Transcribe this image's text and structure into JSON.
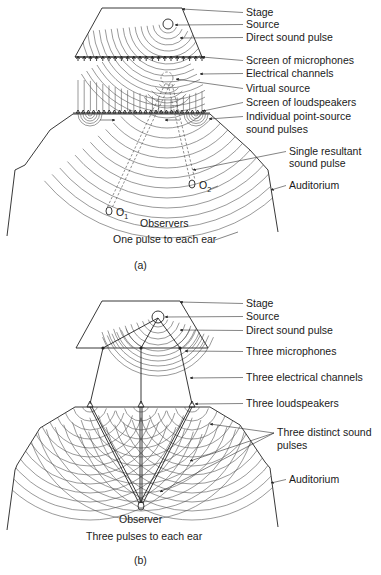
{
  "panel_a": {
    "caption": "(a)",
    "labels": [
      {
        "text": "Stage",
        "x": 246,
        "y": 16,
        "tx": 182,
        "ty": 9
      },
      {
        "text": "Source",
        "x": 246,
        "y": 28,
        "tx": 175,
        "ty": 25
      },
      {
        "text": "Direct sound pulse",
        "x": 246,
        "y": 41,
        "tx": 180,
        "ty": 38
      },
      {
        "text": "Screen of microphones",
        "x": 246,
        "y": 64,
        "tx": 202,
        "ty": 57
      },
      {
        "text": "Electrical channels",
        "x": 246,
        "y": 77,
        "tx": 200,
        "ty": 74
      },
      {
        "text": "Virtual source",
        "x": 246,
        "y": 92,
        "tx": 176,
        "ty": 79
      },
      {
        "text": "Screen of loudspeakers",
        "x": 246,
        "y": 106,
        "tx": 203,
        "ty": 111
      },
      {
        "text": "Individual point-source",
        "x": 246,
        "y": 120,
        "tx": 209,
        "ty": 119
      },
      {
        "text": "sound pulses",
        "x": 246,
        "y": 133,
        "tx": null,
        "ty": null
      },
      {
        "text": "Single resultant",
        "x": 289,
        "y": 155,
        "tx": 193,
        "ty": 170
      },
      {
        "text": "sound pulse",
        "x": 289,
        "y": 167,
        "tx": null,
        "ty": null
      },
      {
        "text": "Auditorium",
        "x": 289,
        "y": 189,
        "tx": 271,
        "ty": 190
      }
    ],
    "observers_label": "Observers",
    "observer_1": {
      "label": "O",
      "sub": "1"
    },
    "observer_2": {
      "label": "O",
      "sub": "2"
    },
    "bottom_note": "One pulse to each ear"
  },
  "panel_b": {
    "caption": "(b)",
    "labels": [
      {
        "text": "Stage",
        "x": 246,
        "y": 307,
        "tx": 180,
        "ty": 302
      },
      {
        "text": "Source",
        "x": 246,
        "y": 320,
        "tx": 165,
        "ty": 317
      },
      {
        "text": "Direct sound pulse",
        "x": 246,
        "y": 334,
        "tx": 180,
        "ty": 330
      },
      {
        "text": "Three microphones",
        "x": 246,
        "y": 355,
        "tx": 185,
        "ty": 351
      },
      {
        "text": "Three electrical channels",
        "x": 246,
        "y": 381,
        "tx": 190,
        "ty": 378
      },
      {
        "text": "Three loudspeakers",
        "x": 246,
        "y": 407,
        "tx": 195,
        "ty": 404
      },
      {
        "text": "Three distinct sound",
        "x": 277,
        "y": 436,
        "tx": null,
        "ty": null
      },
      {
        "text": "pulses",
        "x": 277,
        "y": 449,
        "tx": null,
        "ty": null
      },
      {
        "text": "Auditorium",
        "x": 289,
        "y": 483,
        "tx": 271,
        "ty": 483
      }
    ],
    "distinct_pulse_targets": [
      [
        210,
        424
      ],
      [
        190,
        461
      ],
      [
        160,
        492
      ]
    ],
    "observer_label": "Observer",
    "bottom_note": "Three pulses to each ear"
  }
}
